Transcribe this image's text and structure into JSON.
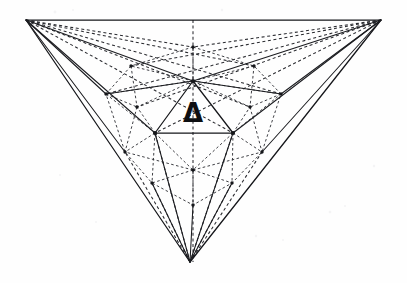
{
  "figure": {
    "kind": "geometric-line-diagram",
    "background_color": "#fefefe",
    "ink_color": "#15161a",
    "label": {
      "text": "Δ",
      "name": "delta-symbol",
      "x": 193,
      "y": 122,
      "font_size": 26
    },
    "vertices": {
      "outer": {
        "top_left": {
          "x": 26,
          "y": 20
        },
        "top_right": {
          "x": 381,
          "y": 20
        },
        "bottom": {
          "x": 190,
          "y": 262
        }
      },
      "mid": {
        "apex": {
          "x": 193,
          "y": 81
        },
        "bottom_left": {
          "x": 155,
          "y": 133
        },
        "bottom_right": {
          "x": 233,
          "y": 133
        }
      },
      "ring": {
        "top_center": {
          "x": 193,
          "y": 47
        },
        "upper_left": {
          "x": 131,
          "y": 66
        },
        "upper_right": {
          "x": 254,
          "y": 66
        },
        "left_outer": {
          "x": 106,
          "y": 94
        },
        "right_outer": {
          "x": 281,
          "y": 94
        },
        "mid_left": {
          "x": 137,
          "y": 107
        },
        "mid_right": {
          "x": 250,
          "y": 107
        },
        "lower_left": {
          "x": 125,
          "y": 152
        },
        "lower_right": {
          "x": 262,
          "y": 152
        },
        "low_left": {
          "x": 152,
          "y": 183
        },
        "low_right": {
          "x": 232,
          "y": 183
        },
        "center_low": {
          "x": 193,
          "y": 170
        },
        "bottom_inner": {
          "x": 193,
          "y": 205
        }
      }
    },
    "line_styles": {
      "outer_edges": "solid",
      "inner_triangle": "solid",
      "subdivision_web": "dashed",
      "center_axis": "dashed"
    },
    "counts": {
      "solid_segments": 21,
      "dashed_segments": 46,
      "nodes": 19
    }
  }
}
